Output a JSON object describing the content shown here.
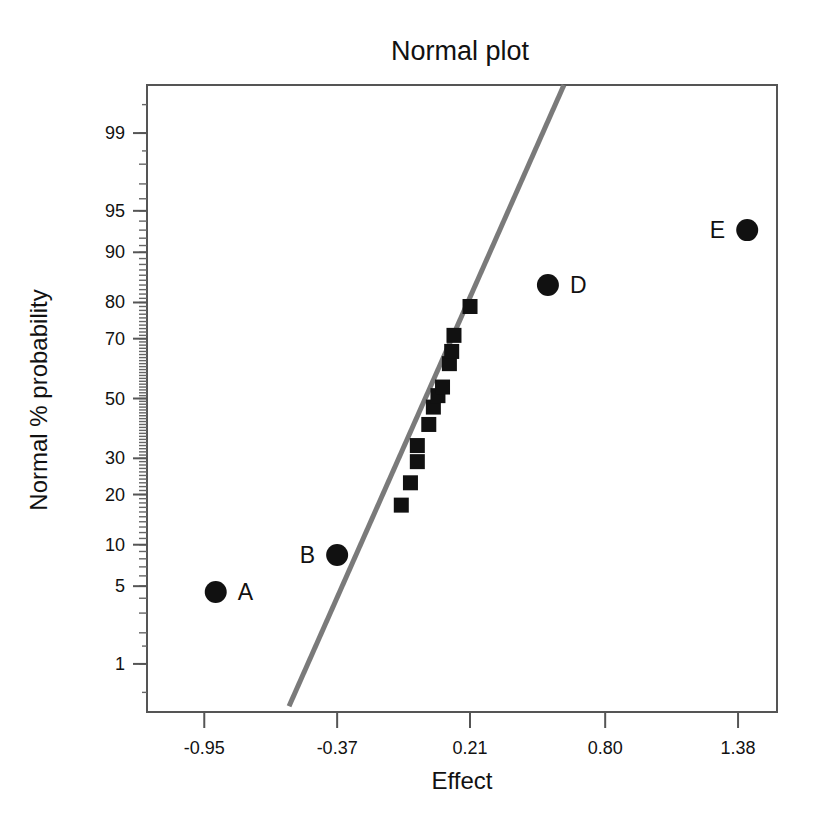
{
  "chart_data": {
    "type": "scatter",
    "title": "Normal plot",
    "xlabel": "Effect",
    "ylabel": "Normal % probability",
    "grid": false,
    "legend": "none",
    "xlim": [
      -1.2,
      1.55
    ],
    "ylim_percent": [
      0.3,
      99.7
    ],
    "x_ticks": [
      "-0.95",
      "-0.37",
      "0.21",
      "0.80",
      "1.38"
    ],
    "x_tick_values": [
      -0.95,
      -0.37,
      0.21,
      0.8,
      1.38
    ],
    "y_ticks": [
      "99",
      "95",
      "90",
      "80",
      "70",
      "50",
      "30",
      "20",
      "10",
      "5",
      "1"
    ],
    "y_tick_values": [
      99,
      95,
      90,
      80,
      70,
      50,
      30,
      20,
      10,
      5,
      1
    ],
    "series": [
      {
        "name": "unlabeled effects",
        "marker": "square",
        "points": [
          {
            "x": -0.09,
            "y": 17.5
          },
          {
            "x": -0.05,
            "y": 23.0
          },
          {
            "x": -0.02,
            "y": 29.0
          },
          {
            "x": -0.02,
            "y": 34.0
          },
          {
            "x": 0.03,
            "y": 41.0
          },
          {
            "x": 0.05,
            "y": 47.0
          },
          {
            "x": 0.07,
            "y": 51.0
          },
          {
            "x": 0.09,
            "y": 54.0
          },
          {
            "x": 0.12,
            "y": 62.0
          },
          {
            "x": 0.13,
            "y": 66.0
          },
          {
            "x": 0.14,
            "y": 71.0
          },
          {
            "x": 0.21,
            "y": 79.0
          }
        ]
      },
      {
        "name": "labeled effects",
        "marker": "circle",
        "points": [
          {
            "label": "A",
            "x": -0.9,
            "y": 4.5
          },
          {
            "label": "B",
            "x": -0.37,
            "y": 8.5
          },
          {
            "label": "D",
            "x": 0.55,
            "y": 84.0
          },
          {
            "label": "E",
            "x": 1.42,
            "y": 93.0
          }
        ]
      }
    ],
    "fit_line": {
      "name": "normal reference line",
      "color": "#7a7a7a",
      "x_start": -0.58,
      "y_start_percent": 0.35,
      "x_end": 0.62,
      "y_end_percent": 99.7
    },
    "point_labels": [
      "A",
      "B",
      "D",
      "E"
    ]
  },
  "colors": {
    "marker": "#111111",
    "line": "#7a7a7a",
    "frame": "#555555",
    "background": "#ffffff",
    "text": "#111111"
  }
}
